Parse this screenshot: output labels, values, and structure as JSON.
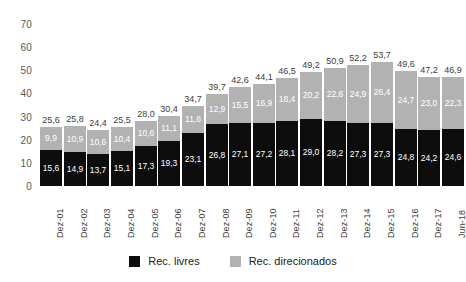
{
  "chart_data": {
    "type": "bar",
    "stacked": true,
    "title": "",
    "xlabel": "",
    "ylabel": "",
    "ylim": [
      0,
      70
    ],
    "yticks": [
      0,
      10,
      20,
      30,
      40,
      50,
      60,
      70
    ],
    "grid": false,
    "legend_position": "bottom",
    "decimal_separator": ",",
    "categories": [
      "Dez-01",
      "Dez-02",
      "Dez-03",
      "Dez-04",
      "Dez-05",
      "Dez-06",
      "Dez-07",
      "Dez-08",
      "Dez-09",
      "Dez-10",
      "Dez-11",
      "Dez-12",
      "Dez-13",
      "Dez-14",
      "Dez-15",
      "Dez-16",
      "Dez-17",
      "Jun-18"
    ],
    "series": [
      {
        "name": "Rec. livres",
        "color": "#0d0d0d",
        "values": [
          15.6,
          14.9,
          13.7,
          15.1,
          17.3,
          19.3,
          23.1,
          26.8,
          27.1,
          27.2,
          28.1,
          29.0,
          28.2,
          27.3,
          27.3,
          24.8,
          24.2,
          24.6
        ],
        "labels": [
          "15,6",
          "14,9",
          "13,7",
          "15,1",
          "17,3",
          "19,3",
          "23,1",
          "26,8",
          "27,1",
          "27,2",
          "28,1",
          "29,0",
          "28,2",
          "27,3",
          "27,3",
          "24,8",
          "24,2",
          "24,6"
        ]
      },
      {
        "name": "Rec. direcionados",
        "color": "#b2b2b2",
        "values": [
          9.9,
          10.9,
          10.6,
          10.4,
          10.6,
          11.1,
          11.6,
          12.9,
          15.5,
          16.9,
          18.4,
          20.2,
          22.6,
          24.9,
          26.4,
          24.7,
          23.0,
          22.3
        ],
        "labels": [
          "9,9",
          "10,9",
          "10,6",
          "10,4",
          "10,6",
          "11,1",
          "11,6",
          "12,9",
          "15,5",
          "16,9",
          "18,4",
          "20,2",
          "22,6",
          "24,9",
          "26,4",
          "24,7",
          "23,0",
          "22,3"
        ]
      }
    ],
    "totals": [
      25.6,
      25.8,
      24.4,
      25.5,
      28.0,
      30.4,
      34.7,
      39.7,
      42.6,
      44.1,
      46.5,
      49.2,
      50.9,
      52.2,
      53.7,
      49.6,
      47.2,
      46.9
    ],
    "total_labels": [
      "25,6",
      "25,8",
      "24,4",
      "25,5",
      "28,0",
      "30,4",
      "34,7",
      "39,7",
      "42,6",
      "44,1",
      "46,5",
      "49,2",
      "50,9",
      "52,2",
      "53,7",
      "49,6",
      "47,2",
      "46,9"
    ]
  },
  "legend": [
    {
      "label": "Rec. livres",
      "color": "#0d0d0d"
    },
    {
      "label": "Rec. direcionados",
      "color": "#b2b2b2"
    }
  ],
  "ytick_labels": [
    "0",
    "10",
    "20",
    "30",
    "40",
    "50",
    "60",
    "70"
  ]
}
